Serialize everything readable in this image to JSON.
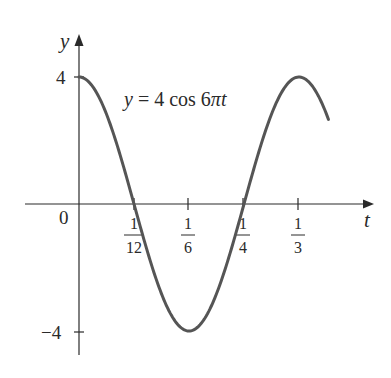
{
  "chart_data": {
    "type": "line",
    "title": "",
    "equation": "y = 4 cos 6πt",
    "equation_parts": {
      "lhs": "y",
      "eq": " = 4 cos 6",
      "pi": "π",
      "var": "t"
    },
    "function": {
      "amplitude": 4,
      "angular_frequency": "6π",
      "form": "A*cos(w*t)"
    },
    "xlabel": "t",
    "ylabel": "y",
    "xlim": [
      0,
      0.39
    ],
    "ylim": [
      -4,
      4
    ],
    "grid": false,
    "origin_label": "0",
    "x_ticks": [
      {
        "value": 0.0833,
        "num": "1",
        "den": "12"
      },
      {
        "value": 0.1667,
        "num": "1",
        "den": "6"
      },
      {
        "value": 0.25,
        "num": "1",
        "den": "4"
      },
      {
        "value": 0.3333,
        "num": "1",
        "den": "3"
      }
    ],
    "y_ticks": [
      {
        "value": 4,
        "label": "4"
      },
      {
        "value": -4,
        "label": "−4"
      }
    ],
    "series": [
      {
        "name": "y = 4 cos 6πt",
        "x": [
          0,
          0.0417,
          0.0833,
          0.125,
          0.1667,
          0.2083,
          0.25,
          0.2917,
          0.3333,
          0.375
        ],
        "values": [
          4,
          2.83,
          0,
          -2.83,
          -4,
          -2.83,
          0,
          2.83,
          4,
          2.83
        ]
      }
    ],
    "colors": {
      "curve": "#555555",
      "axes": "#2a2a2a"
    }
  }
}
